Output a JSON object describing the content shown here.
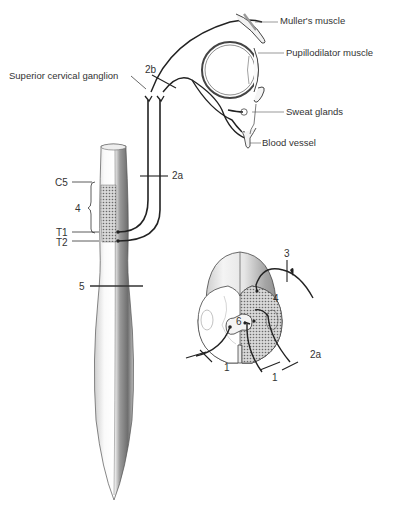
{
  "labels": {
    "muller": "Muller's muscle",
    "pupillodilator": "Pupillodilator muscle",
    "sweat": "Sweat glands",
    "blood": "Blood vessel",
    "superior_ganglion": "Superior cervical ganglion"
  },
  "numbers": {
    "n2b": "2b",
    "n2a_top": "2a",
    "c5": "C5",
    "n4": "4",
    "t1": "T1",
    "t2": "T2",
    "n5": "5",
    "n3": "3",
    "n6": "6",
    "n1_left": "1",
    "n1_right": "1",
    "n2a_cross": "2a",
    "n4_cross": "4"
  },
  "colors": {
    "line": "#2a2a2a",
    "hatch": "#8a8a8a"
  }
}
